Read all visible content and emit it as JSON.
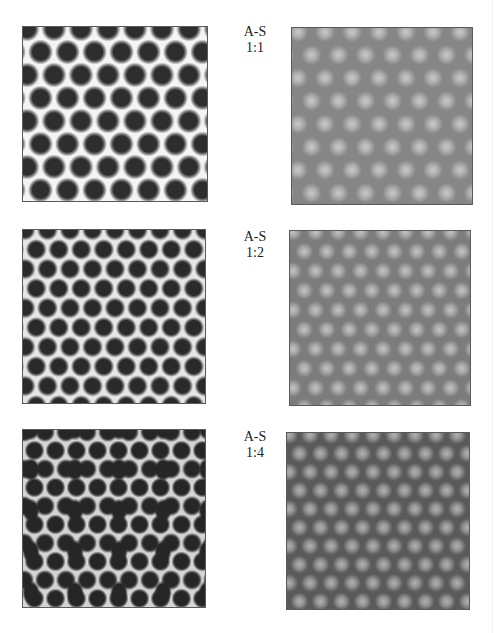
{
  "figure": {
    "rows": [
      {
        "label_line1": "A-S",
        "label_line2": "1:1",
        "left_panel": {
          "description": "hexagonal lattice of dark dots on light background",
          "background": "#f4f4f4",
          "dot_color": "#2e2e2e"
        },
        "right_panel": {
          "description": "hexagonal lattice of light diffuse spots on gray background",
          "background": "#868686",
          "spot_color": "#c8c8c8"
        }
      },
      {
        "label_line1": "A-S",
        "label_line2": "1:2",
        "left_panel": {
          "description": "denser hexagonal lattice of dark dots on light gray background",
          "background": "#e6e6e6",
          "dot_color": "#2a2a2a"
        },
        "right_panel": {
          "description": "denser lattice of light spots on gray background",
          "background": "#7c7c7c",
          "spot_color": "#c4c4c4"
        }
      },
      {
        "label_line1": "A-S",
        "label_line2": "1:4",
        "left_panel": {
          "description": "disordered dots and elongated stripes of dark domains on gray-white background",
          "background": "#d4d4d4",
          "dot_color": "#262626"
        },
        "right_panel": {
          "description": "disordered light spots and stripes on dark gray background",
          "background": "#5a5a5a",
          "spot_color": "#b0b0b0"
        }
      }
    ]
  }
}
